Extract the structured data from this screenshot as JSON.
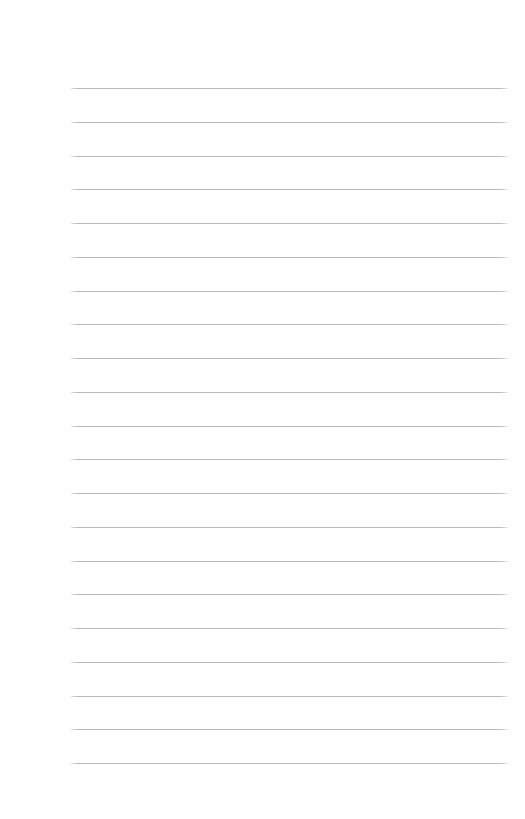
{
  "page": {
    "type": "lined-notebook-page",
    "width": 525,
    "height": 819,
    "background_color": "#ffffff",
    "content_text": "",
    "has_text_content": false,
    "has_header": false,
    "has_footer": false,
    "has_page_number": false,
    "has_margin_rule": false
  },
  "ruling": {
    "line_color": "#b9babc",
    "line_thickness_px": 1,
    "line_count": 21,
    "line_left_x": 71,
    "line_right_x": 508,
    "line_length_px": 437,
    "first_line_y": 88,
    "last_line_y": 763,
    "line_spacing_px": 33.75,
    "line_y_positions": [
      88,
      121.75,
      155.5,
      189.25,
      223,
      256.75,
      290.5,
      324.25,
      358,
      391.75,
      425.5,
      459.25,
      493,
      526.75,
      560.5,
      594.25,
      628,
      661.75,
      695.5,
      729.25,
      763
    ]
  },
  "margins": {
    "top_px": 88,
    "bottom_px": 55,
    "left_px": 71,
    "right_px": 17
  }
}
